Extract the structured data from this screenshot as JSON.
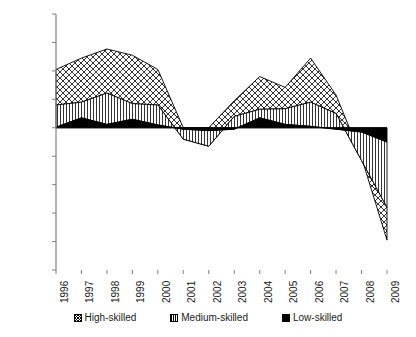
{
  "chart_data": {
    "type": "area",
    "stacked": true,
    "title": "",
    "xlabel": "",
    "ylabel": "",
    "ylim": [
      -5,
      4
    ],
    "ytick_labels": [
      "4%",
      "3%",
      "2%",
      "1%",
      "0%",
      "-1%",
      "-2%",
      "-3%",
      "-4%",
      "-5%"
    ],
    "ytick_values": [
      4,
      3,
      2,
      1,
      0,
      -1,
      -2,
      -3,
      -4,
      -5
    ],
    "grid": false,
    "legend_position": "bottom",
    "categories": [
      1996,
      1997,
      1998,
      1999,
      2000,
      2001,
      2002,
      2003,
      2004,
      2005,
      2006,
      2007,
      2008,
      2009
    ],
    "xtick_labels": [
      "1996",
      "1997",
      "1998",
      "1999",
      "2000",
      "2001",
      "2002",
      "2003",
      "2004",
      "2005",
      "2006",
      "2007",
      "2008",
      "2009"
    ],
    "series": [
      {
        "name": "Low-skilled",
        "pattern": "solid-black",
        "color": "#000000",
        "values": [
          0.02,
          0.35,
          0.12,
          0.3,
          0.1,
          -0.05,
          -0.1,
          -0.05,
          0.35,
          0.12,
          0.05,
          -0.05,
          -0.15,
          -0.5
        ]
      },
      {
        "name": "Medium-skilled",
        "pattern": "vertical-lines",
        "color": "#ffffff",
        "values": [
          0.78,
          0.55,
          1.1,
          0.55,
          0.7,
          -0.35,
          -0.55,
          0.45,
          0.3,
          0.55,
          0.85,
          0.55,
          -1.0,
          -2.3
        ]
      },
      {
        "name": "High-skilled",
        "pattern": "diagonal-crosshatch",
        "color": "#ffffff",
        "values": [
          1.25,
          1.55,
          1.55,
          1.7,
          1.25,
          0.4,
          0.65,
          0.55,
          1.15,
          0.75,
          1.55,
          0.65,
          0.1,
          -1.15
        ]
      }
    ],
    "cumulative_totals": [
      2.05,
      2.45,
      2.77,
      2.55,
      2.05,
      0.0,
      0.0,
      0.95,
      1.8,
      1.42,
      2.45,
      1.15,
      -1.05,
      -3.95
    ]
  },
  "legend": {
    "items": [
      {
        "label": "High-skilled",
        "swatch": "high-skilled-swatch"
      },
      {
        "label": "Medium-skilled",
        "swatch": "medium-skilled-swatch"
      },
      {
        "label": "Low-skilled",
        "swatch": "low-skilled-swatch"
      }
    ]
  }
}
